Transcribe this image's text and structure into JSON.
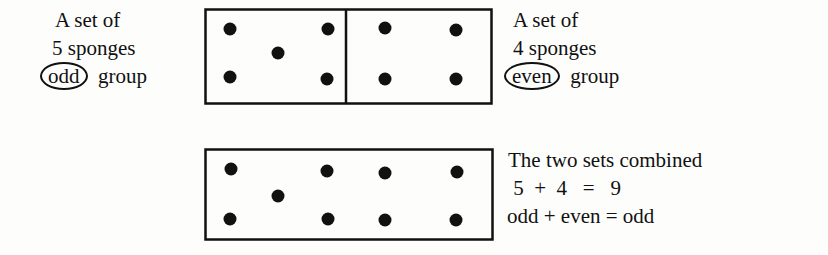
{
  "left_label": {
    "line1": "A set of",
    "line2": "5 sponges",
    "circled": "odd",
    "suffix": "group"
  },
  "right_label": {
    "line1": "A set of",
    "line2": "4 sponges",
    "circled": "even",
    "suffix": "group"
  },
  "combined_label": {
    "line1": "The two sets combined",
    "line2": " 5  +  4   =   9",
    "line3": "odd + even = odd"
  },
  "sets": {
    "first": {
      "count": 5,
      "parity": "odd"
    },
    "second": {
      "count": 4,
      "parity": "even"
    },
    "combined": {
      "count": 9,
      "parity": "odd"
    }
  },
  "colors": {
    "ink": "#111111",
    "paper": "#fdfdfc"
  }
}
